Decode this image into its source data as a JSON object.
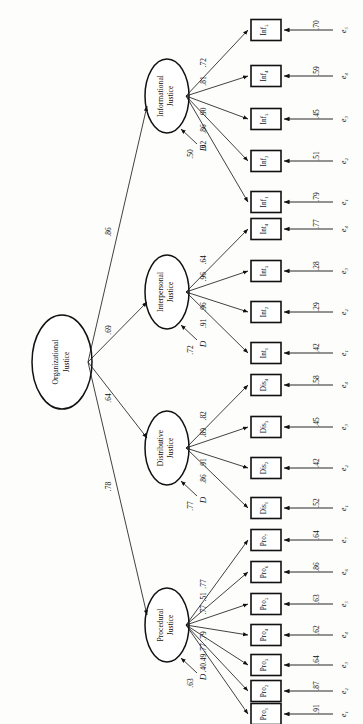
{
  "figure": {
    "type": "sem-path-diagram",
    "orientation": "rotated-90-ccw",
    "second_order_factor": {
      "label_line1": "Organizational",
      "label_line2": "Justice"
    },
    "disturbance_symbol": "D"
  },
  "factors": [
    {
      "id": "informational",
      "line1": "Informational",
      "line2": "Justice",
      "structural_path": ".86",
      "disturbance": ".50",
      "indicators": [
        {
          "name": "Inf",
          "sub": "1",
          "loading": ".62",
          "error_label": "e",
          "error_sub": "1",
          "error_value": ".79"
        },
        {
          "name": "Inf",
          "sub": "2",
          "loading": ".86",
          "error_label": "e",
          "error_sub": "2",
          "error_value": ".51"
        },
        {
          "name": "Inf",
          "sub": "3",
          "loading": ".90",
          "error_label": "e",
          "error_sub": "3",
          "error_value": ".45"
        },
        {
          "name": "Inf",
          "sub": "4",
          "loading": ".81",
          "error_label": "e",
          "error_sub": "4",
          "error_value": ".59"
        },
        {
          "name": "Inf",
          "sub": "5",
          "loading": ".72",
          "error_label": "e",
          "error_sub": "5",
          "error_value": ".70"
        }
      ]
    },
    {
      "id": "interpersonal",
      "line1": "Interpersonal",
      "line2": "Justice",
      "structural_path": ".69",
      "disturbance": ".72",
      "indicators": [
        {
          "name": "Int",
          "sub": "1",
          "loading": ".91",
          "error_label": "e",
          "error_sub": "1",
          "error_value": ".42"
        },
        {
          "name": "Int",
          "sub": "2",
          "loading": ".96",
          "error_label": "e",
          "error_sub": "2",
          "error_value": ".29"
        },
        {
          "name": "Int",
          "sub": "3",
          "loading": ".96",
          "error_label": "e",
          "error_sub": "3",
          "error_value": ".28"
        },
        {
          "name": "Int",
          "sub": "4",
          "loading": ".64",
          "error_label": "e",
          "error_sub": "4",
          "error_value": ".77"
        }
      ]
    },
    {
      "id": "distributive",
      "line1": "Distributive",
      "line2": "Justice",
      "structural_path": ".64",
      "disturbance": ".77",
      "indicators": [
        {
          "name": "Dis",
          "sub": "1",
          "loading": ".86",
          "error_label": "e",
          "error_sub": "1",
          "error_value": ".52"
        },
        {
          "name": "Dis",
          "sub": "2",
          "loading": ".91",
          "error_label": "e",
          "error_sub": "2",
          "error_value": ".42"
        },
        {
          "name": "Dis",
          "sub": "3",
          "loading": ".89",
          "error_label": "e",
          "error_sub": "3",
          "error_value": ".45"
        },
        {
          "name": "Dis",
          "sub": "4",
          "loading": ".82",
          "error_label": "e",
          "error_sub": "4",
          "error_value": ".58"
        }
      ]
    },
    {
      "id": "procedural",
      "line1": "Procedural",
      "line2": "Justice",
      "structural_path": ".78",
      "disturbance": ".63",
      "indicators": [
        {
          "name": "Pro",
          "sub": "1",
          "loading": ".40",
          "error_label": "e",
          "error_sub": "1",
          "error_value": ".91"
        },
        {
          "name": "Pro",
          "sub": "2",
          "loading": ".49",
          "error_label": "e",
          "error_sub": "2",
          "error_value": ".87"
        },
        {
          "name": "Pro",
          "sub": "3",
          "loading": ".77",
          "error_label": "e",
          "error_sub": "3",
          "error_value": ".64"
        },
        {
          "name": "Pro",
          "sub": "4",
          "loading": ".79",
          "error_label": "e",
          "error_sub": "4",
          "error_value": ".62"
        },
        {
          "name": "Pro",
          "sub": "5",
          "loading": ".77",
          "error_label": "e",
          "error_sub": "5",
          "error_value": ".63"
        },
        {
          "name": "Pro",
          "sub": "6",
          "loading": ".51",
          "error_label": "e",
          "error_sub": "6",
          "error_value": ".86"
        },
        {
          "name": "Pro",
          "sub": "7",
          "loading": ".77",
          "error_label": "e",
          "error_sub": "7",
          "error_value": ".64"
        }
      ]
    }
  ]
}
